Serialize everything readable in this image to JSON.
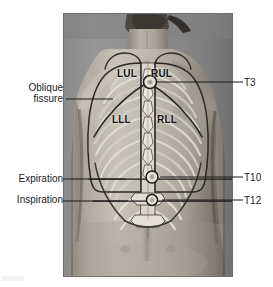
{
  "figure": {
    "type": "anatomical-photograph-with-overlay",
    "plate": {
      "x": 63,
      "y": 13,
      "width": 170,
      "height": 264,
      "background_color": "#8e8e8e",
      "border_color": "#6f6f6f"
    },
    "colors": {
      "page_background": "#ffffff",
      "text": "#1b1b1b",
      "lobe_text": "#111111",
      "overlay_outline": "#2a2a2a",
      "overlay_fill": "#cfcbc2",
      "leader_line": "#1b1b1b",
      "skin_light": "#c9c4bc",
      "skin_mid": "#a49d94",
      "skin_dark": "#6d6660",
      "hair_dark": "#3b3733"
    }
  },
  "annotations": {
    "left": [
      {
        "id": "oblique-fissure",
        "lines": [
          "Oblique",
          "fissure"
        ],
        "line1": "Oblique",
        "line2": "fissure",
        "leader": {
          "x1": 66,
          "y1": 99,
          "x2": 113,
          "y2": 99
        }
      },
      {
        "id": "expiration",
        "lines": [
          "Expiration"
        ],
        "line1": "Expiration",
        "leader": {
          "x1": 63,
          "y1": 179,
          "x2": 120,
          "y2": 179
        }
      },
      {
        "id": "inspiration",
        "lines": [
          "Inspiration"
        ],
        "line1": "Inspiration",
        "leader": {
          "x1": 63,
          "y1": 201,
          "x2": 122,
          "y2": 201
        }
      }
    ],
    "right": [
      {
        "id": "t3",
        "label": "T3",
        "leader": {
          "x1": 156,
          "y1": 82,
          "x2": 243,
          "y2": 82
        }
      },
      {
        "id": "t10",
        "label": "T10",
        "leader": {
          "x1": 160,
          "y1": 177,
          "x2": 243,
          "y2": 177
        }
      },
      {
        "id": "t12",
        "label": "T12",
        "leader": {
          "x1": 162,
          "y1": 200,
          "x2": 243,
          "y2": 200
        }
      }
    ]
  },
  "lung_lobes": [
    {
      "id": "lul",
      "label": "LUL",
      "meaning": "left upper lobe",
      "x": 117,
      "y": 68
    },
    {
      "id": "rul",
      "label": "RUL",
      "meaning": "right upper lobe",
      "x": 151,
      "y": 68
    },
    {
      "id": "lll",
      "label": "LLL",
      "meaning": "left lower lobe",
      "x": 112,
      "y": 114
    },
    {
      "id": "rll",
      "label": "RLL",
      "meaning": "right lower lobe",
      "x": 157,
      "y": 114
    }
  ],
  "landmarks": {
    "vertebral_markers": [
      {
        "id": "t3",
        "label": "T3",
        "cx": 150,
        "cy": 82,
        "r": 6.5
      },
      {
        "id": "t10",
        "label": "T10",
        "cx": 152,
        "cy": 177,
        "r": 6.0
      },
      {
        "id": "t12",
        "label": "T12",
        "cx": 152,
        "cy": 200,
        "r": 5.5
      }
    ],
    "diaphragm_levels": [
      {
        "id": "expiration",
        "label": "Expiration",
        "y": 179
      },
      {
        "id": "inspiration",
        "label": "Inspiration",
        "y": 201
      }
    ]
  }
}
